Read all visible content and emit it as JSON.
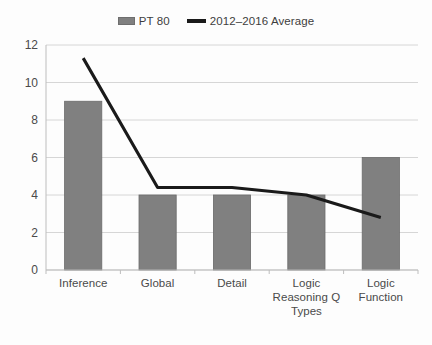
{
  "legend": {
    "position": "top-center",
    "entries": [
      {
        "label": "PT 80",
        "marker": "bar-swatch-icon",
        "color": "#808080"
      },
      {
        "label": "2012–2016 Average",
        "marker": "line-swatch-icon",
        "color": "#1a1a1a"
      }
    ]
  },
  "axes": {
    "y_ticks": [
      "12",
      "10",
      "8",
      "6",
      "4",
      "2",
      "0"
    ],
    "x_labels": [
      "Inference",
      "Global",
      "Detail",
      "Logic\nReasoning Q\nTypes",
      "Logic\nFunction"
    ]
  },
  "chart_data": {
    "type": "bar",
    "title": "",
    "subtitle": "",
    "xlabel": "",
    "ylabel": "",
    "ylim": [
      0,
      12
    ],
    "ytick_step": 2,
    "grid": true,
    "legend_position": "top-center",
    "categories": [
      "Inference",
      "Global",
      "Detail",
      "Logic Reasoning Q Types",
      "Logic Function"
    ],
    "series": [
      {
        "name": "PT 80",
        "type": "bar",
        "color": "#808080",
        "values": [
          9,
          4,
          4,
          4,
          6
        ]
      },
      {
        "name": "2012–2016 Average",
        "type": "line",
        "color": "#1a1a1a",
        "values": [
          11.3,
          4.4,
          4.4,
          4.0,
          2.8
        ]
      }
    ]
  },
  "style": {
    "bar_fill": "#808080",
    "bar_stroke": "#6b6b6b",
    "line_color": "#1a1a1a",
    "grid_color": "#d6d6d6",
    "axis_color": "#bdbdbd",
    "text_color": "#4a4a4a",
    "background": "#fdfdfd"
  }
}
